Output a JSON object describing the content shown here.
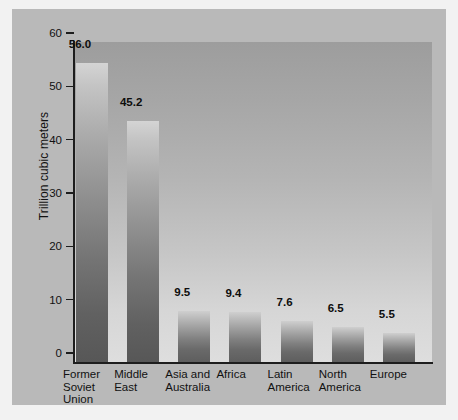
{
  "chart_data": {
    "type": "bar",
    "title": "",
    "xlabel": "",
    "ylabel": "Trillion cubic meters",
    "ylim": [
      0,
      60
    ],
    "yticks": [
      0,
      10,
      20,
      30,
      40,
      50,
      60
    ],
    "ytick_labels": [
      "0",
      "10",
      "20",
      "30",
      "40",
      "50",
      "60"
    ],
    "grid": false,
    "legend": null,
    "categories": [
      "Former\nSoviet\nUnion",
      "Middle\nEast",
      "Asia and\nAustralia",
      "Africa",
      "Latin\nAmerica",
      "North\nAmerica",
      "Europe"
    ],
    "values": [
      56.0,
      45.2,
      9.5,
      9.4,
      7.6,
      6.5,
      5.5
    ],
    "value_labels": [
      "56.0",
      "45.2",
      "9.5",
      "9.4",
      "7.6",
      "6.5",
      "5.5"
    ]
  },
  "colors": {
    "figure_background": "#f2f2f2",
    "panel_background": "#b9b9b9",
    "plot_gradient_top": "#9d9d9d",
    "plot_gradient_bottom": "#dedede",
    "bar_gradient_top": "#d4d4d4",
    "bar_gradient_bottom": "#575757",
    "axis_color": "#1d1d1d",
    "text_color": "#111111"
  }
}
